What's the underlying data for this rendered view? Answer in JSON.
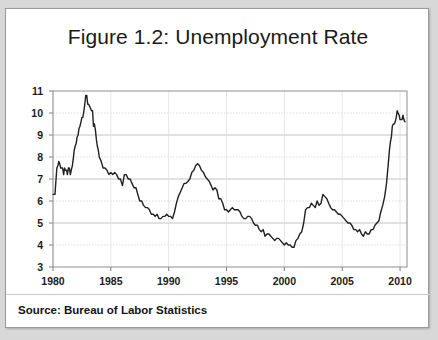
{
  "figure": {
    "title": "Figure 1.2: Unemployment Rate",
    "source": "Source: Bureau of Labor Statistics"
  },
  "chart_data": {
    "type": "line",
    "title": "Figure 1.2: Unemployment Rate",
    "subtitle": "",
    "xlabel": "",
    "ylabel": "",
    "xlim": [
      1980,
      2010.6
    ],
    "ylim": [
      3,
      11
    ],
    "xticks": [
      1980,
      1985,
      1990,
      1995,
      2000,
      2005,
      2010
    ],
    "yticks": [
      3,
      4,
      5,
      6,
      7,
      8,
      9,
      10,
      11
    ],
    "xtick_labels": [
      "1980",
      "1985",
      "1990",
      "1995",
      "2000",
      "2005",
      "2010"
    ],
    "ytick_labels": [
      "3",
      "4",
      "5",
      "6",
      "7",
      "8",
      "9",
      "10",
      "11"
    ],
    "grid": true,
    "legend": false,
    "line_color": "#202020",
    "line_width": 1.4,
    "annotations": [],
    "series": [
      {
        "name": "Unemployment Rate",
        "units": "percent",
        "x": [
          1980.0,
          1980.08,
          1980.17,
          1980.25,
          1980.33,
          1980.42,
          1980.5,
          1980.58,
          1980.67,
          1980.75,
          1980.83,
          1980.92,
          1981.0,
          1981.08,
          1981.17,
          1981.25,
          1981.33,
          1981.42,
          1981.5,
          1981.58,
          1981.67,
          1981.75,
          1981.83,
          1981.92,
          1982.0,
          1982.08,
          1982.17,
          1982.25,
          1982.33,
          1982.42,
          1982.5,
          1982.58,
          1982.67,
          1982.75,
          1982.83,
          1982.92,
          1983.0,
          1983.08,
          1983.17,
          1983.25,
          1983.33,
          1983.42,
          1983.5,
          1983.58,
          1983.67,
          1983.75,
          1983.83,
          1983.92,
          1984.0,
          1984.17,
          1984.33,
          1984.5,
          1984.67,
          1984.83,
          1985.0,
          1985.17,
          1985.33,
          1985.5,
          1985.67,
          1985.83,
          1986.0,
          1986.17,
          1986.33,
          1986.5,
          1986.67,
          1986.83,
          1987.0,
          1987.17,
          1987.33,
          1987.5,
          1987.67,
          1987.83,
          1988.0,
          1988.17,
          1988.33,
          1988.5,
          1988.67,
          1988.83,
          1989.0,
          1989.17,
          1989.33,
          1989.5,
          1989.67,
          1989.83,
          1990.0,
          1990.17,
          1990.33,
          1990.5,
          1990.67,
          1990.83,
          1991.0,
          1991.17,
          1991.33,
          1991.5,
          1991.67,
          1991.83,
          1992.0,
          1992.17,
          1992.33,
          1992.5,
          1992.67,
          1992.83,
          1993.0,
          1993.17,
          1993.33,
          1993.5,
          1993.67,
          1993.83,
          1994.0,
          1994.17,
          1994.33,
          1994.5,
          1994.67,
          1994.83,
          1995.0,
          1995.17,
          1995.33,
          1995.5,
          1995.67,
          1995.83,
          1996.0,
          1996.17,
          1996.33,
          1996.5,
          1996.67,
          1996.83,
          1997.0,
          1997.17,
          1997.33,
          1997.5,
          1997.67,
          1997.83,
          1998.0,
          1998.17,
          1998.33,
          1998.5,
          1998.67,
          1998.83,
          1999.0,
          1999.17,
          1999.33,
          1999.5,
          1999.67,
          1999.83,
          2000.0,
          2000.17,
          2000.33,
          2000.5,
          2000.67,
          2000.83,
          2001.0,
          2001.17,
          2001.33,
          2001.5,
          2001.67,
          2001.83,
          2002.0,
          2002.17,
          2002.33,
          2002.5,
          2002.67,
          2002.83,
          2003.0,
          2003.17,
          2003.33,
          2003.5,
          2003.67,
          2003.83,
          2004.0,
          2004.17,
          2004.33,
          2004.5,
          2004.67,
          2004.83,
          2005.0,
          2005.17,
          2005.33,
          2005.5,
          2005.67,
          2005.83,
          2006.0,
          2006.17,
          2006.33,
          2006.5,
          2006.67,
          2006.83,
          2007.0,
          2007.17,
          2007.33,
          2007.5,
          2007.67,
          2007.83,
          2008.0,
          2008.17,
          2008.33,
          2008.5,
          2008.67,
          2008.83,
          2009.0,
          2009.08,
          2009.17,
          2009.25,
          2009.33,
          2009.42,
          2009.5,
          2009.58,
          2009.67,
          2009.75,
          2009.83,
          2009.92,
          2010.0,
          2010.08,
          2010.17,
          2010.25,
          2010.33,
          2010.42
        ],
        "values": [
          6.3,
          6.3,
          6.3,
          6.9,
          7.5,
          7.6,
          7.8,
          7.7,
          7.5,
          7.5,
          7.5,
          7.2,
          7.5,
          7.4,
          7.4,
          7.2,
          7.5,
          7.5,
          7.2,
          7.4,
          7.6,
          7.9,
          8.3,
          8.5,
          8.6,
          8.9,
          9.0,
          9.3,
          9.4,
          9.6,
          9.8,
          9.8,
          10.1,
          10.4,
          10.8,
          10.8,
          10.4,
          10.4,
          10.3,
          10.2,
          10.1,
          10.1,
          9.4,
          9.5,
          9.2,
          8.8,
          8.5,
          8.3,
          8.0,
          7.8,
          7.5,
          7.5,
          7.4,
          7.2,
          7.3,
          7.2,
          7.3,
          7.2,
          7.0,
          7.0,
          6.7,
          7.2,
          7.2,
          7.0,
          7.0,
          6.8,
          6.6,
          6.6,
          6.3,
          6.0,
          6.0,
          5.8,
          5.7,
          5.7,
          5.6,
          5.4,
          5.4,
          5.3,
          5.4,
          5.2,
          5.2,
          5.3,
          5.3,
          5.4,
          5.3,
          5.3,
          5.2,
          5.5,
          5.9,
          6.2,
          6.4,
          6.6,
          6.8,
          6.8,
          6.9,
          7.0,
          7.3,
          7.4,
          7.6,
          7.7,
          7.6,
          7.4,
          7.3,
          7.1,
          7.0,
          6.9,
          6.7,
          6.5,
          6.6,
          6.5,
          6.1,
          6.1,
          5.9,
          5.6,
          5.6,
          5.5,
          5.6,
          5.7,
          5.6,
          5.6,
          5.6,
          5.5,
          5.3,
          5.2,
          5.2,
          5.3,
          5.3,
          5.2,
          5.0,
          4.9,
          4.9,
          4.7,
          4.6,
          4.7,
          4.4,
          4.5,
          4.5,
          4.4,
          4.3,
          4.2,
          4.3,
          4.3,
          4.2,
          4.1,
          4.0,
          4.1,
          4.0,
          4.0,
          3.9,
          3.9,
          4.2,
          4.3,
          4.5,
          4.6,
          5.0,
          5.6,
          5.7,
          5.7,
          5.9,
          5.8,
          5.7,
          6.0,
          5.8,
          5.9,
          6.3,
          6.2,
          6.1,
          5.9,
          5.7,
          5.6,
          5.6,
          5.5,
          5.4,
          5.4,
          5.3,
          5.2,
          5.1,
          5.0,
          5.0,
          4.9,
          4.7,
          4.7,
          4.6,
          4.7,
          4.5,
          4.4,
          4.6,
          4.5,
          4.5,
          4.7,
          4.7,
          4.9,
          5.0,
          5.1,
          5.5,
          5.8,
          6.2,
          6.8,
          7.8,
          8.3,
          8.7,
          8.9,
          9.4,
          9.5,
          9.5,
          9.6,
          9.8,
          10.1,
          10.0,
          9.9,
          9.7,
          9.7,
          9.7,
          9.9,
          9.7,
          9.6
        ]
      }
    ]
  }
}
